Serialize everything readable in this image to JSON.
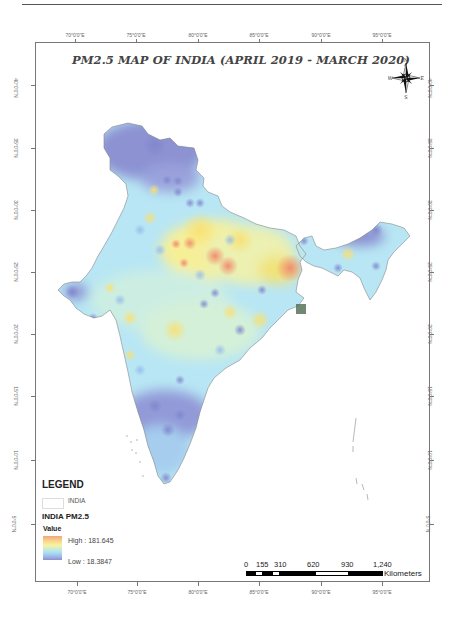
{
  "page": {
    "number": ""
  },
  "map": {
    "title": "PM2.5 MAP OF INDIA (APRIL 2019 - MARCH 2020)",
    "longitude_ticks": [
      "70°0'0\"E",
      "75°0'0\"E",
      "80°0'0\"E",
      "85°0'0\"E",
      "90°0'0\"E",
      "95°0'0\"E"
    ],
    "latitude_ticks": [
      "40°0'0\"N",
      "35°0'0\"N",
      "30°0'0\"N",
      "25°0'0\"N",
      "20°0'0\"N",
      "15°0'0\"N",
      "10°0'0\"N",
      "5°0'0\"N"
    ],
    "compass": {
      "n": "N",
      "s": "S",
      "e": "E",
      "w": "W"
    },
    "colors": {
      "high": "#f4a37f",
      "mid_high": "#f9f3a0",
      "mid": "#c8ecd8",
      "mid_low": "#a9def2",
      "low": "#8a8ed0",
      "boundary": "#888888"
    }
  },
  "legend": {
    "title": "LEGEND",
    "india_label": "INDIA",
    "layer_title": "INDIA PM2.5",
    "value_label": "Value",
    "high_label": "High : 181.645",
    "low_label": "Low : 18.3847"
  },
  "scale_bar": {
    "labels": [
      "0",
      "155",
      "310",
      "620",
      "930",
      "1,240"
    ],
    "unit": "Kilometers"
  }
}
